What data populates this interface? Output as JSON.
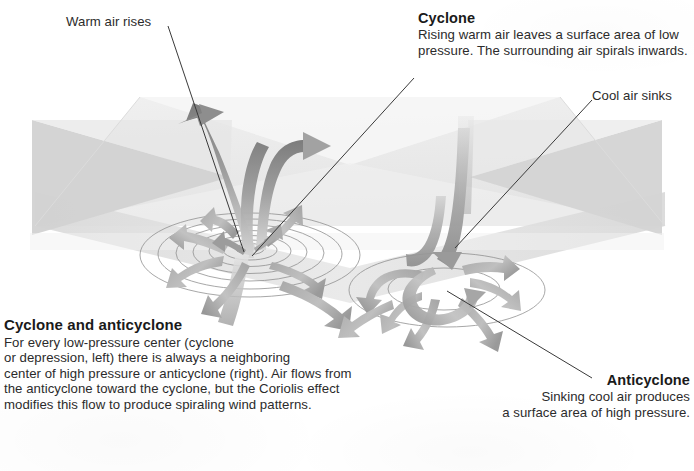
{
  "figure": {
    "background_color": "#ffffff",
    "ink_color": "#231f20"
  },
  "labels": {
    "warm_air": {
      "text": "Warm air rises"
    },
    "cyclone": {
      "heading": "Cyclone",
      "body_line_1": "Rising warm air leaves a surface area of low",
      "body_line_2": "pressure. The surrounding air spirals inwards."
    },
    "cool_air": {
      "text": "Cool air sinks"
    },
    "anticyclone": {
      "heading": "Anticyclone",
      "body_line_1": "Sinking cool air produces",
      "body_line_2": "a surface area of high pressure."
    },
    "caption": {
      "heading": "Cyclone and anticyclone",
      "body_line_1": "For every low-pressure center (cyclone",
      "body_line_2": "or depression, left) there is always a neighboring",
      "body_line_3": "center of high pressure or anticyclone (right). Air flows from",
      "body_line_4": "the anticyclone toward the cyclone, but the Coriolis effect",
      "body_line_5": "modifies this flow to produce spiraling wind patterns."
    }
  },
  "diagram": {
    "slab": {
      "name": "atmosphere-slab",
      "top_face_color": "#ececec",
      "left_face_color": "#d6d6d6",
      "right_face_color": "#dcdcdc",
      "highlight_color": "#f4f4f4"
    },
    "cyclone_system": {
      "name": "cyclone-low-pressure-system",
      "isobar_rings": 7,
      "flow_direction": "inward-and-upward",
      "center_x": 250,
      "center_y": 255
    },
    "anticyclone_system": {
      "name": "anticyclone-high-pressure-system",
      "isobar_rings": 2,
      "flow_direction": "downward-and-outward",
      "center_x": 445,
      "center_y": 290
    },
    "arrow_color_dark": "#8a8a8a",
    "arrow_color_light": "#c9c9c9",
    "isobar_line_color": "#8d8d8d"
  }
}
